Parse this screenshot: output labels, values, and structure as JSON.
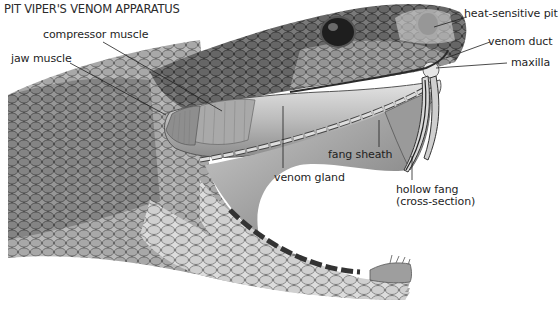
{
  "title": "PIT VIPER'S VENOM APPARATUS",
  "labels": {
    "compressor_muscle": "compressor muscle",
    "jaw_muscle": "jaw muscle",
    "heat_sensitive_pit": "heat-sensitive pit",
    "venom_duct": "venom duct",
    "maxilla": "maxilla",
    "fang_sheath": "fang sheath",
    "venom_gland": "venom gland",
    "hollow_fang_line1": "hollow fang",
    "hollow_fang_line2": "(cross-section)"
  },
  "colors": {
    "background": "#ffffff",
    "scale_dark": "#3a3a3a",
    "scale_mid": "#8a8a8a",
    "scale_light": "#c8c8c8",
    "leader_line": "#1e1e1e"
  }
}
